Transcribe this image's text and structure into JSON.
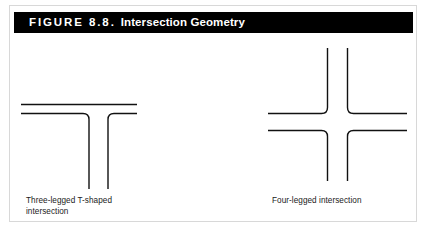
{
  "figure": {
    "frame_color": "#d8d8d8",
    "title_bar": {
      "background": "#000000",
      "text_color": "#ffffff",
      "number_label": "FIGURE 8.8.",
      "name_label": "Intersection Geometry",
      "full_label": "FIGURE 8.8. Intersection Geometry"
    },
    "line_color": "#111111",
    "diagrams": [
      {
        "id": "three-legged-t",
        "icon_name": "t-intersection-diagram",
        "caption": "Three-legged T-shaped\nintersection",
        "caption_line_1": "Three-legged T-shaped",
        "caption_line_2": "intersection",
        "legs": 3
      },
      {
        "id": "four-legged-cross",
        "icon_name": "cross-intersection-diagram",
        "caption": "Four-legged intersection",
        "caption_line_1": "Four-legged intersection",
        "legs": 4
      }
    ]
  }
}
